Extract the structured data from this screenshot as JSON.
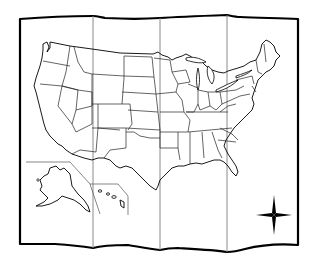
{
  "map": {
    "subject": "Outline map of the United States",
    "style": "folded paper, four panels, black outline",
    "fold_count": 3,
    "insets": [
      "Alaska",
      "Hawaii"
    ],
    "decorations": [
      "compass-rose"
    ],
    "colors": {
      "paper": "#ffffff",
      "outline": "#000000",
      "fold_lines": "#8a8a8a"
    }
  }
}
